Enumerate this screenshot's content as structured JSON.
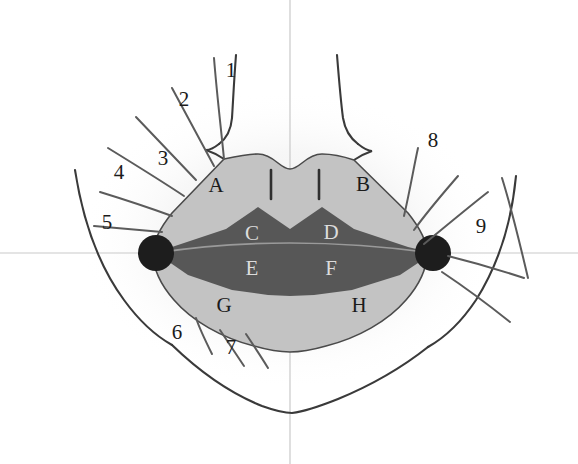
{
  "figure": {
    "canvas": {
      "width": 578,
      "height": 464
    },
    "background_color": "#ffffff"
  },
  "colors": {
    "background": "#ffffff",
    "lip_skin_fill": "#c3c3c3",
    "vermillion_fill": "#575757",
    "commissure_marker": "#1d1d1d",
    "outline_stroke": "#3a3a3a",
    "radial_line_stroke": "#5b5b5b",
    "axis_line": "#c9c9c9",
    "halo_glow": "#efefef",
    "label_text": "#1b1b1b"
  },
  "zone_labels": [
    {
      "id": "A",
      "text": "A",
      "x": 216,
      "y": 185,
      "region": "upper-left-cutaneous-lip"
    },
    {
      "id": "B",
      "text": "B",
      "x": 363,
      "y": 184,
      "region": "upper-right-cutaneous-lip"
    },
    {
      "id": "C",
      "text": "C",
      "x": 252,
      "y": 233,
      "region": "upper-left-vermillion"
    },
    {
      "id": "D",
      "text": "D",
      "x": 331,
      "y": 232,
      "region": "upper-right-vermillion"
    },
    {
      "id": "E",
      "text": "E",
      "x": 252,
      "y": 268,
      "region": "lower-left-vermillion"
    },
    {
      "id": "F",
      "text": "F",
      "x": 331,
      "y": 268,
      "region": "lower-right-vermillion"
    },
    {
      "id": "G",
      "text": "G",
      "x": 224,
      "y": 305,
      "region": "lower-left-cutaneous-lip"
    },
    {
      "id": "H",
      "text": "H",
      "x": 359,
      "y": 305,
      "region": "lower-right-cutaneous-lip"
    }
  ],
  "index_labels": [
    {
      "id": "1",
      "text": "1",
      "x": 231,
      "y": 70
    },
    {
      "id": "2",
      "text": "2",
      "x": 184,
      "y": 99
    },
    {
      "id": "3",
      "text": "3",
      "x": 163,
      "y": 158
    },
    {
      "id": "4",
      "text": "4",
      "x": 119,
      "y": 172
    },
    {
      "id": "5",
      "text": "5",
      "x": 107,
      "y": 222
    },
    {
      "id": "6",
      "text": "6",
      "x": 177,
      "y": 332
    },
    {
      "id": "7",
      "text": "7",
      "x": 231,
      "y": 347
    },
    {
      "id": "8",
      "text": "8",
      "x": 433,
      "y": 140
    },
    {
      "id": "9",
      "text": "9",
      "x": 481,
      "y": 226
    }
  ],
  "markers": {
    "left_commissure": {
      "cx": 156,
      "cy": 253,
      "r": 18
    },
    "right_commissure": {
      "cx": 433,
      "cy": 253,
      "r": 18
    }
  },
  "axes": {
    "horizontal": {
      "y": 253,
      "x1": 0,
      "x2": 578
    },
    "vertical": {
      "x": 290,
      "y1": 0,
      "y2": 464
    }
  },
  "philtrum_columns": [
    {
      "x": 271,
      "y1": 170,
      "y2": 199
    },
    {
      "x": 319,
      "y1": 170,
      "y2": 199
    }
  ]
}
